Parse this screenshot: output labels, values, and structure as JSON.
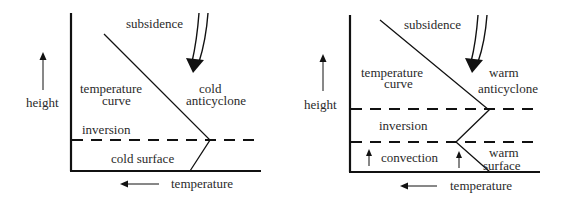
{
  "diagram": {
    "colors": {
      "line": "#111111",
      "text": "#2a2a2a",
      "background": "#ffffff"
    },
    "panels": [
      {
        "id": "cold-anticyclone",
        "labels": {
          "subsidence": "subsidence",
          "temperature_curve_1": "temperature",
          "temperature_curve_2": "curve",
          "type_1": "cold",
          "type_2": "anticyclone",
          "inversion": "inversion",
          "surface": "cold surface",
          "height_axis": "height",
          "temperature_axis": "temperature"
        }
      },
      {
        "id": "warm-anticyclone",
        "labels": {
          "subsidence": "subsidence",
          "temperature_curve_1": "temperature",
          "temperature_curve_2": "curve",
          "type_1": "warm",
          "type_2": "anticyclone",
          "inversion": "inversion",
          "convection": "convection",
          "surface_1": "warm",
          "surface_2": "surface",
          "height_axis": "height",
          "temperature_axis": "temperature"
        }
      }
    ]
  }
}
